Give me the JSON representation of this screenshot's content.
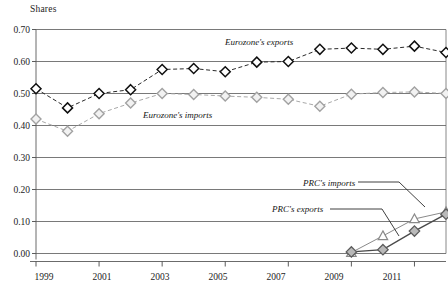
{
  "chart_data": {
    "type": "line",
    "title": "",
    "ylabel": "Shares",
    "xlabel": "",
    "ylim": [
      0.0,
      0.7
    ],
    "xlim": [
      1999,
      2012
    ],
    "grid": true,
    "legend_position": "inline-annotations",
    "ytick_labels": [
      "0.70",
      "0.60",
      "0.50",
      "0.40",
      "0.30",
      "0.20",
      "0.10",
      "0.00"
    ],
    "ytick_values": [
      0.7,
      0.6,
      0.5,
      0.4,
      0.3,
      0.2,
      0.1,
      0.0
    ],
    "xtick_labels": [
      "1999",
      "2001",
      "2003",
      "2005",
      "2007",
      "2009",
      "2011"
    ],
    "xtick_values": [
      1999,
      2001,
      2003,
      2005,
      2007,
      2009,
      2011
    ],
    "x": [
      1999,
      2000,
      2001,
      2002,
      2003,
      2004,
      2005,
      2006,
      2007,
      2008,
      2009,
      2010,
      2011,
      2012
    ],
    "series": [
      {
        "name": "Eurozone's exports",
        "marker": "diamond-dark",
        "color": "#1a1a1a",
        "values": [
          0.515,
          0.455,
          0.5,
          0.512,
          0.575,
          0.578,
          0.568,
          0.598,
          0.6,
          0.638,
          0.642,
          0.638,
          0.648,
          0.628
        ]
      },
      {
        "name": "Eurozone's imports",
        "marker": "diamond-light",
        "color": "#9a9a9a",
        "values": [
          0.42,
          0.382,
          0.437,
          0.47,
          0.5,
          0.497,
          0.492,
          0.488,
          0.482,
          0.46,
          0.498,
          0.503,
          0.505,
          0.5
        ]
      },
      {
        "name": "PRC's imports",
        "marker": "triangle-open",
        "color": "#8c8c8c",
        "values": [
          null,
          null,
          null,
          null,
          null,
          null,
          null,
          null,
          null,
          null,
          0.003,
          0.055,
          0.108,
          0.13
        ]
      },
      {
        "name": "PRC's exports",
        "marker": "diamond-grey",
        "color": "#6d6d6d",
        "values": [
          null,
          null,
          null,
          null,
          null,
          null,
          null,
          null,
          null,
          null,
          0.005,
          0.012,
          0.07,
          0.123
        ]
      }
    ],
    "annotations": [
      {
        "text": "Eurozone's exports",
        "series": "Eurozone's exports"
      },
      {
        "text": "Eurozone's imports",
        "series": "Eurozone's imports"
      },
      {
        "text": "PRC's imports",
        "series": "PRC's imports"
      },
      {
        "text": "PRC's exports",
        "series": "PRC's exports"
      }
    ]
  },
  "labels": {
    "y_axis_title": "Shares",
    "y0": "0.70",
    "y1": "0.60",
    "y2": "0.50",
    "y3": "0.40",
    "y4": "0.30",
    "y5": "0.20",
    "y6": "0.10",
    "y7": "0.00",
    "x0": "1999",
    "x1": "2001",
    "x2": "2003",
    "x3": "2005",
    "x4": "2007",
    "x5": "2009",
    "x6": "2011",
    "ann_ez_exports": "Eurozone's exports",
    "ann_ez_imports": "Eurozone's imports",
    "ann_prc_imports": "PRC's imports",
    "ann_prc_exports": "PRC's exports"
  }
}
